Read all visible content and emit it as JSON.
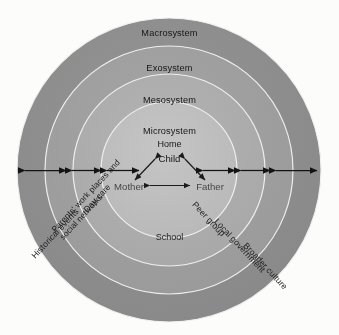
{
  "figure": {
    "type": "concentric-rings-diagram",
    "background_color": "#fdfdfc",
    "rings": [
      {
        "id": "macrosystem",
        "heading": "Macrosystem",
        "fill": "#8e8e8e",
        "outer_radius": 152,
        "level": 4
      },
      {
        "id": "exosystem",
        "heading": "Exosystem",
        "fill": "#9e9e9e",
        "outer_radius": 124,
        "level": 3
      },
      {
        "id": "mesosystem",
        "heading": "Mesosystem",
        "fill": "#adadad",
        "outer_radius": 96,
        "level": 2
      },
      {
        "id": "microsystem",
        "heading": "Microsystem",
        "fill": "#bdbdbd",
        "outer_radius": 68,
        "level": 1
      }
    ],
    "center": {
      "x": 169,
      "y": 170
    },
    "core": {
      "home_label": "Home",
      "child_label": "Child",
      "mother_label": "Mother",
      "father_label": "Father"
    },
    "mid_labels": {
      "school": "School"
    },
    "arc_labels": {
      "historical_events": "Historical events",
      "parents_work": "Parents' work places and social networks",
      "day_care": "Day care",
      "peer_group": "Peer group",
      "local_government": "Local government",
      "broader_culture": "Broader culture"
    },
    "arrows": {
      "horizontal_double_arrow_count_left": 3,
      "horizontal_double_arrow_count_right": 3,
      "core_arrow_pairs": [
        "child-mother",
        "child-father",
        "mother-father"
      ],
      "color": "#141416"
    },
    "ring_outline_color": "#efefef"
  }
}
